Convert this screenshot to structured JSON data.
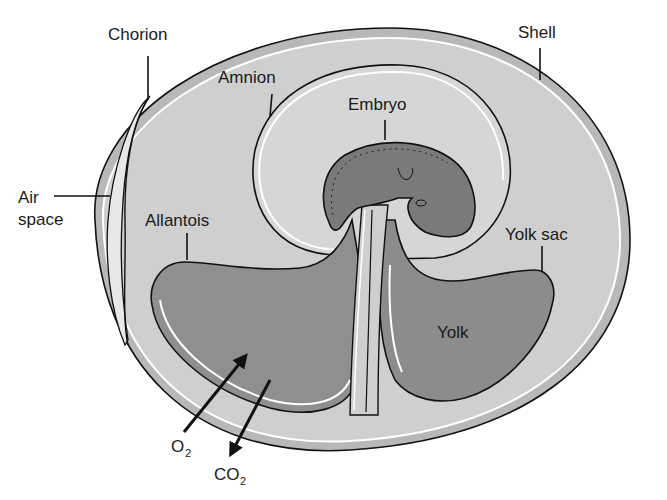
{
  "labels": {
    "chorion": "Chorion",
    "shell": "Shell",
    "amnion": "Amnion",
    "embryo": "Embryo",
    "air_space_line1": "Air",
    "air_space_line2": "space",
    "allantois": "Allantois",
    "yolk_sac": "Yolk sac",
    "yolk": "Yolk",
    "o2_main": "O",
    "o2_sub": "2",
    "co2_main": "CO",
    "co2_sub": "2"
  },
  "colors": {
    "background": "#ffffff",
    "shell_band": "#b8b8b8",
    "albumen": "#cfcfcf",
    "amnion_fluid": "#d6d6d6",
    "allantois_fill": "#8f8f8f",
    "yolk_fill": "#8c8c8c",
    "embryo_fill": "#7a7a7a",
    "outline": "#111111"
  }
}
